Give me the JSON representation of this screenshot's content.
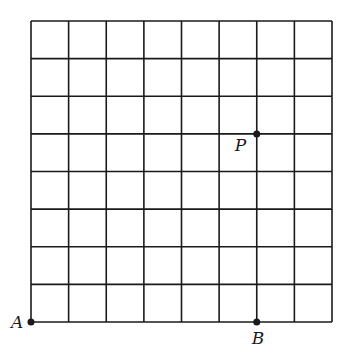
{
  "diagram": {
    "type": "lattice-grid",
    "columns": 8,
    "rows": 8,
    "grid": {
      "x0": 31,
      "y0": 21,
      "x1": 332,
      "y1": 322
    },
    "line_color": "#1a1a1a",
    "points": [
      {
        "id": "A",
        "label": "A",
        "col": 0,
        "row": 0,
        "label_dx": -20,
        "label_dy": 6
      },
      {
        "id": "P",
        "label": "P",
        "col": 6,
        "row": 5,
        "label_dx": -22,
        "label_dy": 17
      },
      {
        "id": "B",
        "label": "B",
        "col": 6,
        "row": 0,
        "label_dx": -5,
        "label_dy": 22
      }
    ]
  }
}
